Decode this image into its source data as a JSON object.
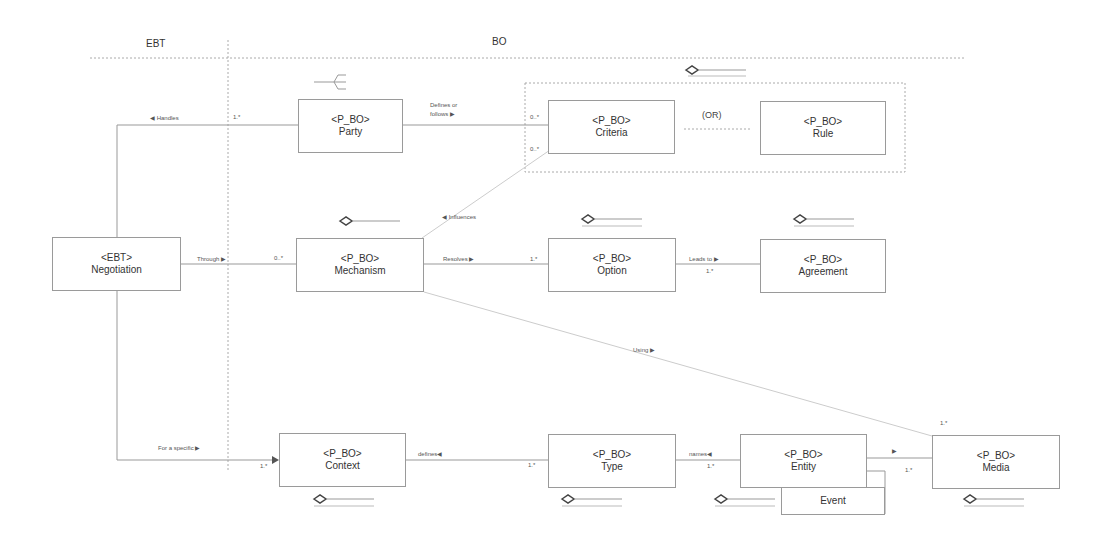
{
  "swimlanes": {
    "left": "EBT",
    "right": "BO"
  },
  "classes": {
    "negotiation": {
      "stereotype": "<EBT>",
      "name": "Negotiation"
    },
    "party": {
      "stereotype": "<P_BO>",
      "name": "Party"
    },
    "criteria": {
      "stereotype": "<P_BO>",
      "name": "Criteria"
    },
    "rule": {
      "stereotype": "<P_BO>",
      "name": "Rule"
    },
    "mechanism": {
      "stereotype": "<P_BO>",
      "name": "Mechanism"
    },
    "option": {
      "stereotype": "<P_BO>",
      "name": "Option"
    },
    "agreement": {
      "stereotype": "<P_BO>",
      "name": "Agreement"
    },
    "context": {
      "stereotype": "<P_BO>",
      "name": "Context"
    },
    "type": {
      "stereotype": "<P_BO>",
      "name": "Type"
    },
    "entity": {
      "stereotype": "<P_BO>",
      "name": "Entity"
    },
    "media": {
      "stereotype": "<P_BO>",
      "name": "Media"
    },
    "event": {
      "name": "Event"
    }
  },
  "constraint": "(OR)",
  "associations": {
    "handles": {
      "label": "◀ Handles",
      "mult": "1.*"
    },
    "defines_or_follows": {
      "label_line1": "Defines or",
      "label_line2": "follows ▶",
      "mult": "0..*"
    },
    "influences": {
      "label": "◀ Influences",
      "mult": "0..*"
    },
    "through": {
      "label": "Through ▶",
      "mult": "0..*"
    },
    "resolves": {
      "label": "Resolves ▶",
      "mult": "1.*"
    },
    "leads_to": {
      "label": "Leads to ▶",
      "mult": "1.*"
    },
    "using": {
      "label": "Using ▶",
      "mult": "1.*"
    },
    "for_a_specific": {
      "label": "For a specific ▶",
      "mult": "1.*"
    },
    "defines": {
      "label": "defines◀",
      "mult": "1.*"
    },
    "names": {
      "label": "names◀",
      "mult": "1.*"
    },
    "entity_media": {
      "label": "▶",
      "mult": "1.*"
    }
  }
}
